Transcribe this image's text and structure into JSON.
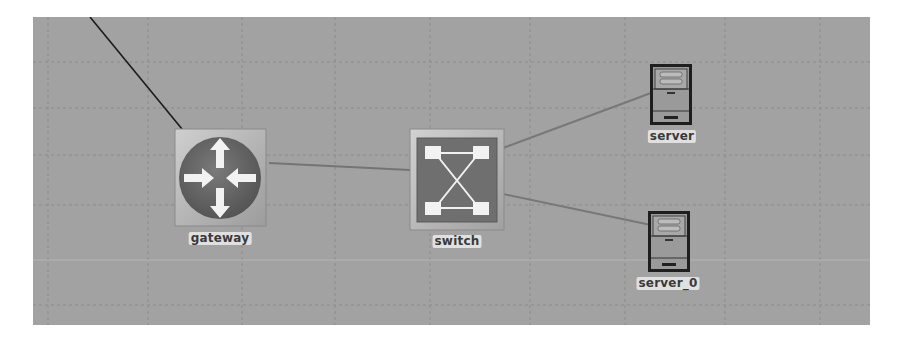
{
  "diagram": {
    "background": "#a2a2a2",
    "grid": {
      "color": "#8e8e8e",
      "vertical_x": [
        15,
        115,
        209,
        302,
        397,
        497,
        592,
        692,
        787
      ],
      "horizontal_y": [
        45,
        91,
        138,
        188,
        243,
        288
      ]
    },
    "colors": {
      "router_circle": "#6b6b6b",
      "router_tile": "#b8b8b8",
      "switch_inner": "#747474",
      "switch_tile": "#bdbdbd",
      "server_body": "#9a9a9a",
      "server_outline": "#1e1e1e",
      "link_color": "#7c7c7c",
      "uplink_color": "#1c1c1c"
    },
    "nodes": [
      {
        "id": "gateway",
        "label": "gateway",
        "type": "router",
        "icon": "router-icon"
      },
      {
        "id": "switch",
        "label": "switch",
        "type": "switch",
        "icon": "switch-icon"
      },
      {
        "id": "server",
        "label": "server",
        "type": "server",
        "icon": "server-icon"
      },
      {
        "id": "server_0",
        "label": "server_0",
        "type": "server",
        "icon": "server-icon"
      }
    ],
    "links": [
      {
        "from": "external",
        "to": "gateway",
        "style": "dark"
      },
      {
        "from": "gateway",
        "to": "switch",
        "style": "normal"
      },
      {
        "from": "switch",
        "to": "server",
        "style": "normal"
      },
      {
        "from": "switch",
        "to": "server_0",
        "style": "normal"
      }
    ]
  }
}
